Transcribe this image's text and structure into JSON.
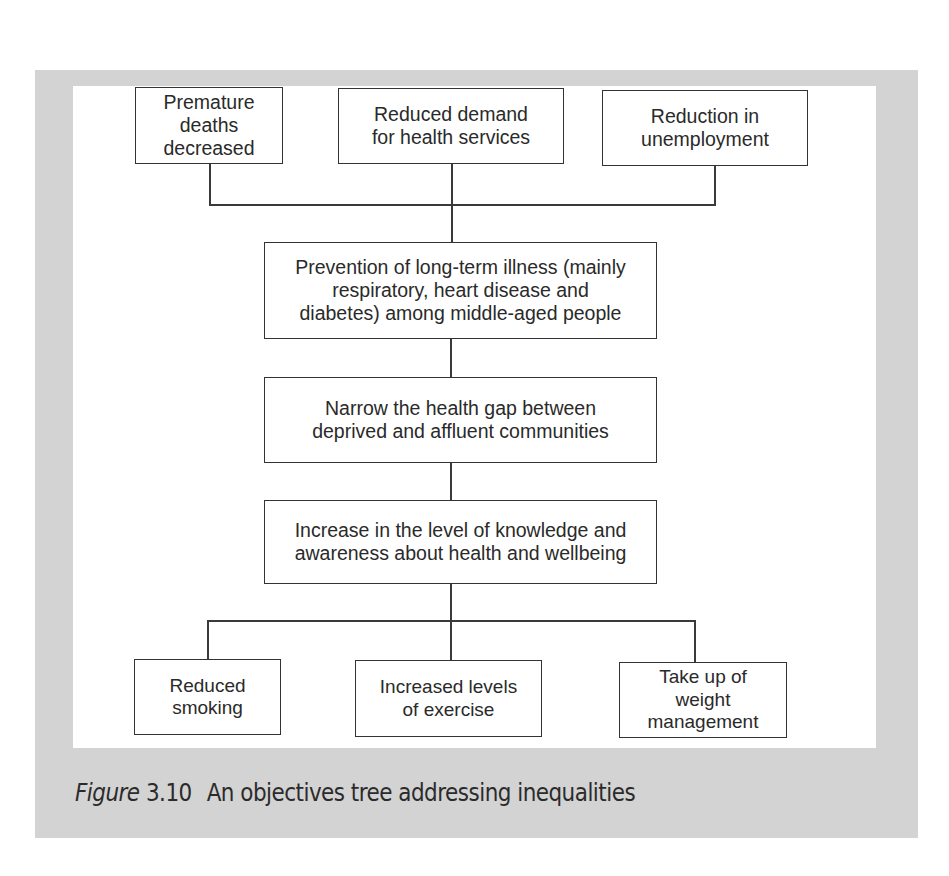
{
  "figure": {
    "label": "Figure",
    "number": "3.10",
    "title": "An objectives tree addressing inequalities",
    "colors": {
      "panel_background": "#d3d3d3",
      "diagram_background": "#ffffff",
      "box_border": "#333333",
      "text": "#2a2a2a"
    }
  },
  "tree": {
    "top_row": [
      {
        "id": "premature-deaths",
        "lines": [
          "Premature",
          "deaths",
          "decreased"
        ]
      },
      {
        "id": "reduced-demand",
        "lines": [
          "Reduced demand",
          "for health services"
        ]
      },
      {
        "id": "reduction-unemployment",
        "lines": [
          "Reduction in",
          "unemployment"
        ]
      }
    ],
    "middle_chain": [
      {
        "id": "prevention-illness",
        "lines": [
          "Prevention of long-term illness (mainly",
          "respiratory, heart disease and",
          "diabetes) among middle-aged people"
        ]
      },
      {
        "id": "narrow-health-gap",
        "lines": [
          "Narrow the health gap between",
          "deprived and affluent communities"
        ]
      },
      {
        "id": "increase-knowledge",
        "lines": [
          "Increase in the level of knowledge and",
          "awareness about health and wellbeing"
        ]
      }
    ],
    "bottom_row": [
      {
        "id": "reduced-smoking",
        "lines": [
          "Reduced",
          "smoking"
        ]
      },
      {
        "id": "increased-exercise",
        "lines": [
          "Increased levels",
          "of exercise"
        ]
      },
      {
        "id": "weight-management",
        "lines": [
          "Take up of",
          "weight",
          "management"
        ]
      }
    ]
  }
}
